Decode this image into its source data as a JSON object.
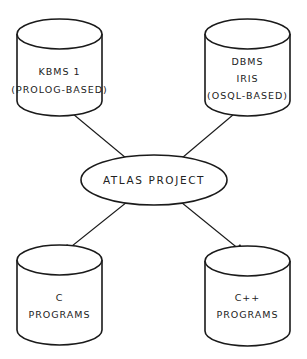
{
  "diagram": {
    "type": "hub-and-spoke",
    "center": {
      "shape": "ellipse",
      "label": "ATLAS PROJECT"
    },
    "nodes": [
      {
        "id": "kbms",
        "shape": "cylinder",
        "position": "top-left",
        "lines": [
          "KBMS 1",
          "(PROLOG-BASED)"
        ]
      },
      {
        "id": "dbms-iris",
        "shape": "cylinder",
        "position": "top-right",
        "lines": [
          "DBMS",
          "IRIS",
          "(OSQL-BASED)"
        ]
      },
      {
        "id": "c-programs",
        "shape": "cylinder",
        "position": "bottom-left",
        "lines": [
          "C",
          "PROGRAMS"
        ]
      },
      {
        "id": "cpp-programs",
        "shape": "cylinder",
        "position": "bottom-right",
        "lines": [
          "C++",
          "PROGRAMS"
        ]
      }
    ],
    "edges": [
      {
        "from": "center",
        "to": "kbms",
        "direction": "bidirectional"
      },
      {
        "from": "center",
        "to": "dbms-iris",
        "direction": "bidirectional"
      },
      {
        "from": "center",
        "to": "c-programs",
        "direction": "bidirectional"
      },
      {
        "from": "center",
        "to": "cpp-programs",
        "direction": "bidirectional"
      }
    ],
    "colors": {
      "stroke": "#1a1a1a",
      "background": "#ffffff",
      "text": "#222222"
    }
  }
}
